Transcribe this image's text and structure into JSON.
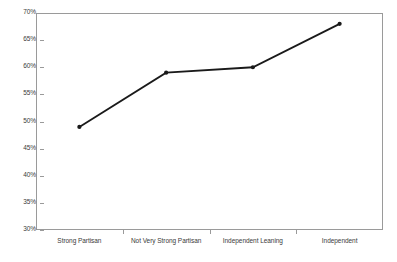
{
  "chart_data": {
    "type": "line",
    "title": "",
    "subtitle": "",
    "xlabel": "",
    "ylabel": "",
    "categories": [
      "Strong Partisan",
      "Not Very Strong Partisan",
      "Independent Leaning",
      "Independent"
    ],
    "values": [
      49,
      59,
      60,
      68
    ],
    "value_labels": [
      "49%",
      "59%",
      "60%",
      "68%"
    ],
    "ylim": [
      30,
      70
    ],
    "ytick_step": 5,
    "ytick_labels": [
      "70%",
      "65%",
      "60%",
      "55%",
      "50%",
      "45%",
      "40%",
      "35%",
      "30%"
    ],
    "ytick_values": [
      70,
      65,
      60,
      55,
      50,
      45,
      40,
      35,
      30
    ],
    "grid": false,
    "legend": null,
    "legend_position": "none",
    "series": [
      {
        "name": "",
        "values": [
          49,
          59,
          60,
          68
        ],
        "line_color": "#1a1a1a",
        "marker": "circle",
        "marker_color": "#1a1a1a"
      }
    ],
    "annotations": []
  },
  "style": {
    "background": "#ffffff",
    "frame_color": "#9a9a9a",
    "tick_color": "#9a9a9a",
    "text_color": "#3a3a3a",
    "line_color": "#1a1a1a"
  }
}
